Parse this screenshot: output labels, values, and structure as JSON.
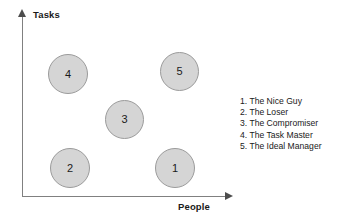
{
  "chart_data": {
    "type": "scatter",
    "title": "",
    "xlabel": "People",
    "ylabel": "Tasks",
    "xlim": [
      0,
      10
    ],
    "ylim": [
      0,
      10
    ],
    "grid": false,
    "legend_position": "right",
    "axis_arrows": true,
    "point_shape": "circle",
    "point_fill": "#d5d5d5",
    "point_border": "#9b9b9b",
    "points": [
      {
        "label": "1",
        "name": "The Nice Guy",
        "x": 8.0,
        "y": 2.0,
        "px": 155,
        "py": 148,
        "size": 40
      },
      {
        "label": "2",
        "name": "The Loser",
        "x": 2.0,
        "y": 2.0,
        "px": 50,
        "py": 148,
        "size": 40
      },
      {
        "label": "3",
        "name": "The Compromiser",
        "x": 5.0,
        "y": 5.0,
        "px": 105,
        "py": 100,
        "size": 39
      },
      {
        "label": "4",
        "name": "The Task Master",
        "x": 2.0,
        "y": 8.0,
        "px": 48,
        "py": 54,
        "size": 40
      },
      {
        "label": "5",
        "name": "The Ideal Manager",
        "x": 8.0,
        "y": 8.0,
        "px": 160,
        "py": 52,
        "size": 39
      }
    ],
    "legend": [
      "1. The Nice Guy",
      "2. The Loser",
      "3. The Compromiser",
      "4. The Task Master",
      "5. The Ideal Manager"
    ]
  }
}
